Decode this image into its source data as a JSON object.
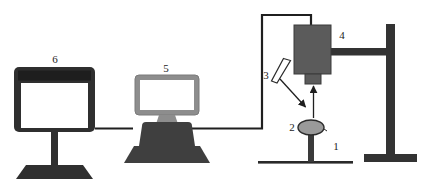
{
  "figure": {
    "kind": "schematic-diagram",
    "title": "",
    "background": "#ffffff"
  },
  "colors": {
    "outline_dark": "#262626",
    "body_dark": "#3a3a3a",
    "body_mid": "#4a4a4a",
    "gray_mid": "#6e6e6e",
    "gray_light": "#9a9a9a",
    "screen_white": "#ffffff",
    "cable": "#1f1f1f",
    "label_text": "#1c1c1c"
  },
  "labels": {
    "sample_stage": "1",
    "sample": "2",
    "mirror": "3",
    "detector_head": "4",
    "computer": "5",
    "display_monitor": "6"
  },
  "components": [
    {
      "id": "1",
      "name": "sample-stage-baseline",
      "label": "1"
    },
    {
      "id": "2",
      "name": "sample-specimen",
      "label": "2"
    },
    {
      "id": "3",
      "name": "mirror-plate",
      "label": "3"
    },
    {
      "id": "4",
      "name": "detector-head",
      "label": "4"
    },
    {
      "id": "5",
      "name": "computer-workstation",
      "label": "5"
    },
    {
      "id": "6",
      "name": "display-monitor",
      "label": "6"
    }
  ]
}
